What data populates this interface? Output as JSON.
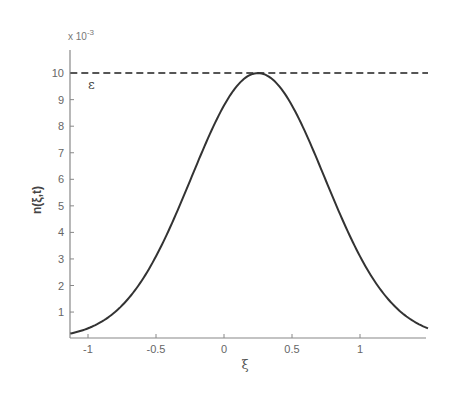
{
  "chart_data": {
    "type": "line",
    "title": "",
    "xlabel": "ξ",
    "ylabel": "n(ξ,t)",
    "y_multiplier_label": "x 10",
    "y_multiplier_exponent": "-3",
    "xlim": [
      -1.13,
      1.5
    ],
    "ylim": [
      0,
      10.8
    ],
    "x_ticks": [
      -1,
      -0.5,
      0,
      0.5,
      1
    ],
    "x_tick_labels": [
      "-1",
      "-0.5",
      "0",
      "0.5",
      "1"
    ],
    "y_ticks": [
      1,
      2,
      3,
      4,
      5,
      6,
      7,
      8,
      9,
      10
    ],
    "y_tick_labels": [
      "1",
      "2",
      "3",
      "4",
      "5",
      "6",
      "7",
      "8",
      "9",
      "10"
    ],
    "grid": false,
    "legend": null,
    "series": [
      {
        "name": "n(ξ,t)",
        "style": "solid",
        "color": "#333333",
        "shape": "gaussian",
        "peak_x": 0.25,
        "peak_y": 10,
        "sigma": 0.49,
        "x": [
          -1.13,
          -1.0,
          -0.75,
          -0.5,
          -0.25,
          0.0,
          0.1,
          0.25,
          0.4,
          0.5,
          0.75,
          1.0,
          1.25,
          1.5
        ],
        "y": [
          0.19,
          0.38,
          1.25,
          3.1,
          5.94,
          8.78,
          9.54,
          10.0,
          9.54,
          8.78,
          5.94,
          3.1,
          1.25,
          0.38
        ]
      },
      {
        "name": "ε",
        "style": "dashed",
        "color": "#555555",
        "x": [
          -1.13,
          1.5
        ],
        "y": [
          10,
          10
        ]
      }
    ],
    "annotations": [
      {
        "text": "ε",
        "x": -0.95,
        "y": 9.6
      }
    ]
  }
}
